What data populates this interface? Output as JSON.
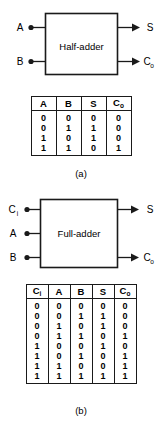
{
  "figure_a": {
    "block_label": "Half-adder",
    "caption": "(a)",
    "inputs": [
      {
        "name": "A",
        "sub": ""
      },
      {
        "name": "B",
        "sub": ""
      }
    ],
    "outputs": [
      {
        "name": "S",
        "sub": ""
      },
      {
        "name": "C",
        "sub": "o"
      }
    ],
    "table": {
      "headers": [
        {
          "name": "A",
          "sub": ""
        },
        {
          "name": "B",
          "sub": ""
        },
        {
          "name": "S",
          "sub": ""
        },
        {
          "name": "C",
          "sub": "o"
        }
      ],
      "rows": [
        [
          "0",
          "0",
          "0",
          "0"
        ],
        [
          "0",
          "1",
          "1",
          "0"
        ],
        [
          "1",
          "0",
          "1",
          "0"
        ],
        [
          "1",
          "1",
          "0",
          "1"
        ]
      ]
    }
  },
  "figure_b": {
    "block_label": "Full-adder",
    "caption": "(b)",
    "inputs": [
      {
        "name": "C",
        "sub": "i"
      },
      {
        "name": "A",
        "sub": ""
      },
      {
        "name": "B",
        "sub": ""
      }
    ],
    "outputs": [
      {
        "name": "S",
        "sub": ""
      },
      {
        "name": "C",
        "sub": "o"
      }
    ],
    "table": {
      "headers": [
        {
          "name": "C",
          "sub": "i"
        },
        {
          "name": "A",
          "sub": ""
        },
        {
          "name": "B",
          "sub": ""
        },
        {
          "name": "S",
          "sub": ""
        },
        {
          "name": "C",
          "sub": "o"
        }
      ],
      "rows": [
        [
          "0",
          "0",
          "0",
          "0",
          "0"
        ],
        [
          "0",
          "0",
          "1",
          "1",
          "0"
        ],
        [
          "0",
          "1",
          "0",
          "1",
          "0"
        ],
        [
          "0",
          "1",
          "1",
          "0",
          "1"
        ],
        [
          "1",
          "0",
          "0",
          "1",
          "0"
        ],
        [
          "1",
          "0",
          "1",
          "0",
          "1"
        ],
        [
          "1",
          "1",
          "0",
          "0",
          "1"
        ],
        [
          "1",
          "1",
          "1",
          "1",
          "1"
        ]
      ]
    }
  },
  "colors": {
    "ink": "#1a1a1a",
    "background": "#ffffff"
  }
}
